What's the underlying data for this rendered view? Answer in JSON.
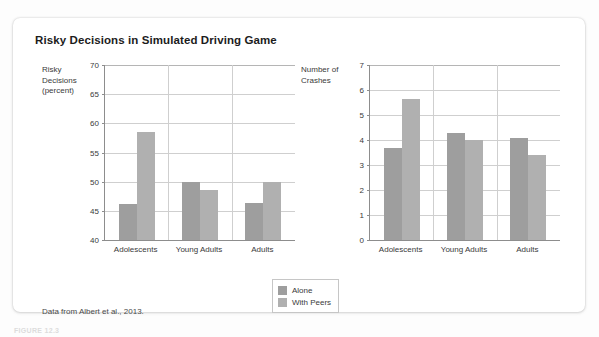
{
  "figure": {
    "title": "Risky Decisions in Simulated Driving Game",
    "source_note": "Data from Albert et al., 2013.",
    "caption": "FIGURE 12.3"
  },
  "legend": {
    "position": "bottom-center",
    "items": [
      {
        "label": "Alone",
        "color": "#9e9e9e"
      },
      {
        "label": "With Peers",
        "color": "#b0b0b0"
      }
    ]
  },
  "colors": {
    "bar_alone": "#9e9e9e",
    "bar_with_peers": "#b0b0b0",
    "axis": "#8d8d8d",
    "grid": "#cfcfcf",
    "card": "#ffffff",
    "text": "#3a3a3a",
    "title_text": "#1c1c1c"
  },
  "chart_data": [
    {
      "id": "risky-decisions",
      "type": "bar",
      "title": "Risky Decisions in Simulated Driving Game",
      "ylabel": "Risky\nDecisions\n(percent)",
      "xlabel": "",
      "ylim": [
        40,
        70
      ],
      "yticks": [
        40,
        45,
        50,
        55,
        60,
        65,
        70
      ],
      "grid": true,
      "categories": [
        "Adolescents",
        "Young Adults",
        "Adults"
      ],
      "series": [
        {
          "name": "Alone",
          "values": [
            46.2,
            50.0,
            46.3
          ]
        },
        {
          "name": "With Peers",
          "values": [
            58.6,
            48.5,
            50.0
          ]
        }
      ]
    },
    {
      "id": "number-of-crashes",
      "type": "bar",
      "title": "",
      "ylabel": "Number of\nCrashes",
      "xlabel": "",
      "ylim": [
        0,
        7
      ],
      "yticks": [
        0,
        1,
        2,
        3,
        4,
        5,
        6,
        7
      ],
      "grid": true,
      "categories": [
        "Adolescents",
        "Young Adults",
        "Adults"
      ],
      "series": [
        {
          "name": "Alone",
          "values": [
            3.7,
            4.3,
            4.1
          ]
        },
        {
          "name": "With Peers",
          "values": [
            5.65,
            4.0,
            3.4
          ]
        }
      ]
    }
  ]
}
